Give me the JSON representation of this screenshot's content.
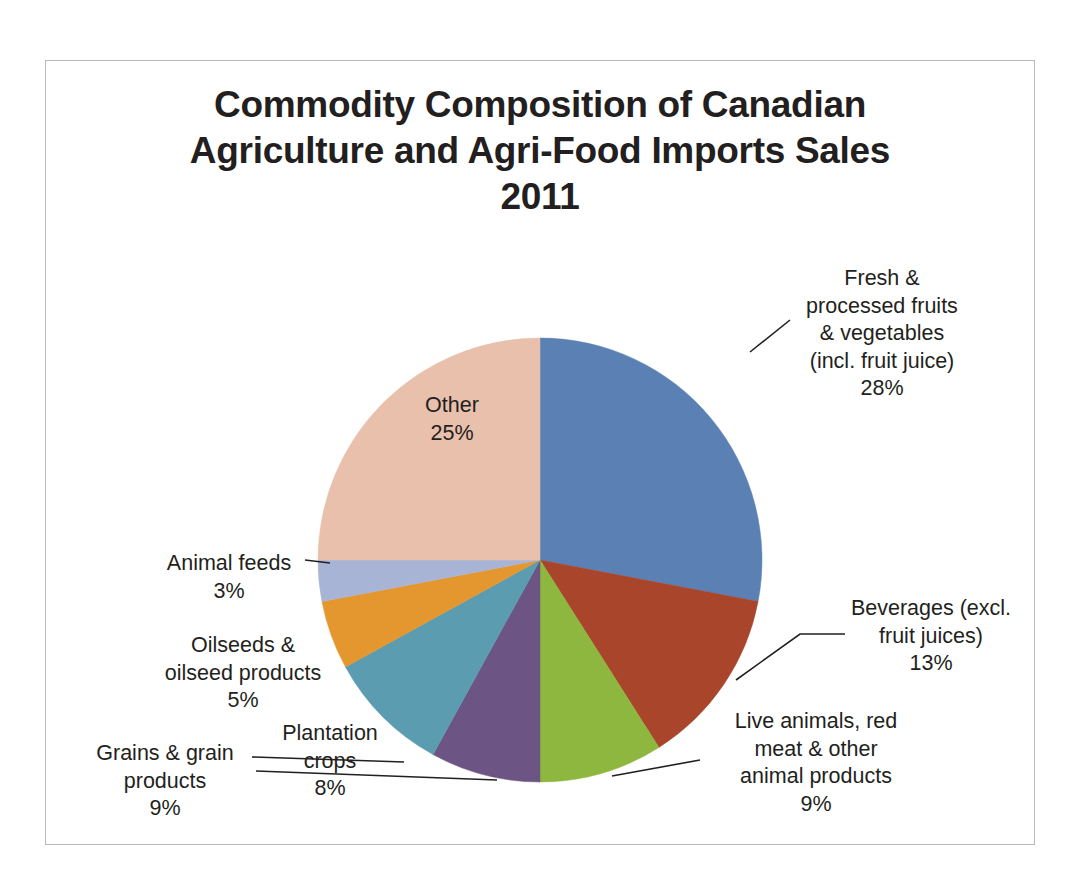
{
  "chart_data": {
    "type": "pie",
    "title": "Commodity Composition of Canadian\nAgriculture and Agri-Food Imports Sales\n2011",
    "xlabel": "",
    "ylabel": "",
    "legend": "none",
    "grid": false,
    "units": "percent",
    "categories": [
      "Fresh & processed fruits & vegetables (incl. fruit juice)",
      "Beverages (excl. fruit juices)",
      "Live animals, red meat & other animal products",
      "Plantation crops",
      "Grains & grain products",
      "Oilseeds & oilseed products",
      "Animal feeds",
      "Other"
    ],
    "values": [
      28,
      13,
      9,
      8,
      9,
      5,
      3,
      25
    ],
    "colors": [
      "#5B80B4",
      "#A8452B",
      "#8DB73F",
      "#6C5584",
      "#5B9CB0",
      "#E5972F",
      "#A8B4D6",
      "#E8C0AC"
    ],
    "slices": [
      {
        "key": "fruits",
        "label": "Fresh &\nprocessed fruits\n& vegetables\n(incl. fruit juice)\n28%",
        "name": "Fresh & processed fruits & vegetables (incl. fruit juice)",
        "value": 28,
        "percent_text": "28%",
        "color": "#5B80B4"
      },
      {
        "key": "beverages",
        "label": "Beverages (excl.\nfruit juices)\n13%",
        "name": "Beverages (excl. fruit juices)",
        "value": 13,
        "percent_text": "13%",
        "color": "#A8452B"
      },
      {
        "key": "live_animals",
        "label": "Live animals, red\nmeat & other\nanimal products\n9%",
        "name": "Live animals, red meat & other animal products",
        "value": 9,
        "percent_text": "9%",
        "color": "#8DB73F"
      },
      {
        "key": "plantation",
        "label": "Plantation\ncrops\n8%",
        "name": "Plantation crops",
        "value": 8,
        "percent_text": "8%",
        "color": "#6C5584"
      },
      {
        "key": "grains",
        "label": "Grains & grain\nproducts\n9%",
        "name": "Grains & grain products",
        "value": 9,
        "percent_text": "9%",
        "color": "#5B9CB0"
      },
      {
        "key": "oilseeds",
        "label": "Oilseeds &\noilseed products\n5%",
        "name": "Oilseeds & oilseed products",
        "value": 5,
        "percent_text": "5%",
        "color": "#E5972F"
      },
      {
        "key": "animal_feeds",
        "label": "Animal feeds\n3%",
        "name": "Animal feeds",
        "value": 3,
        "percent_text": "3%",
        "color": "#A8B4D6"
      },
      {
        "key": "other",
        "label": "Other\n25%",
        "name": "Other",
        "value": 25,
        "percent_text": "25%",
        "color": "#E8C0AC"
      }
    ]
  },
  "colors": {
    "text": "#231f20",
    "frame": "#b9b9b9",
    "background": "#ffffff",
    "leader_line": "#231f20"
  }
}
